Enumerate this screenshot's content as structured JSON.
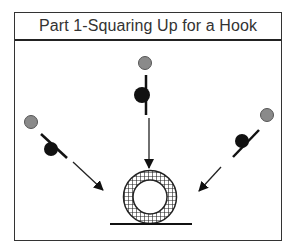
{
  "figure": {
    "title": "Part 1-Squaring Up for a Hook",
    "colors": {
      "border": "#333333",
      "ball_gray": "#8a8a8a",
      "ball_black": "#111111",
      "arrow": "#222222",
      "hatch": "#222222"
    },
    "players": [
      {
        "position": "left",
        "head": "gray-circle",
        "body": "black-ball-with-stick",
        "arrow_direction": "toward-ring"
      },
      {
        "position": "top",
        "head": "gray-circle",
        "body": "black-ball-with-stick",
        "arrow_direction": "toward-ring"
      },
      {
        "position": "right",
        "head": "gray-circle",
        "body": "black-ball-with-stick",
        "arrow_direction": "toward-ring"
      }
    ],
    "target": {
      "shape": "hatched-ring",
      "base": "ground-line"
    }
  }
}
